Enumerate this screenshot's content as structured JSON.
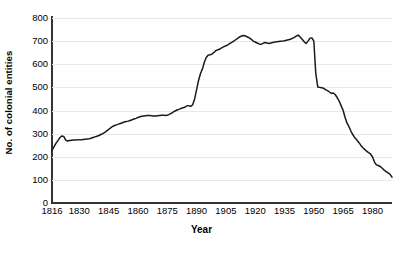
{
  "chart_data": {
    "type": "line",
    "title": "",
    "xlabel": "Year",
    "ylabel": "No. of colonial entities",
    "xlim": [
      1816,
      1990
    ],
    "ylim": [
      0,
      800
    ],
    "grid": true,
    "legend": false,
    "x_ticks": [
      "1816",
      "1830",
      "1845",
      "1860",
      "1875",
      "1890",
      "1905",
      "1920",
      "1935",
      "1950",
      "1965",
      "1980"
    ],
    "x_tick_values": [
      1816,
      1830,
      1845,
      1860,
      1875,
      1890,
      1905,
      1920,
      1935,
      1950,
      1965,
      1980
    ],
    "y_ticks": [
      "0",
      "100",
      "200",
      "300",
      "400",
      "500",
      "600",
      "700",
      "800"
    ],
    "y_tick_values": [
      0,
      100,
      200,
      300,
      400,
      500,
      600,
      700,
      800
    ],
    "line_color": "#1a1a1a",
    "grid_color": "#e8e8e8",
    "axis_color": "#333333",
    "series": [
      {
        "name": "No. of colonial entities",
        "x": [
          1816,
          1817,
          1818,
          1819,
          1820,
          1821,
          1822,
          1823,
          1824,
          1825,
          1826,
          1827,
          1828,
          1829,
          1830,
          1831,
          1832,
          1833,
          1834,
          1835,
          1836,
          1837,
          1838,
          1839,
          1840,
          1841,
          1842,
          1843,
          1844,
          1845,
          1846,
          1847,
          1848,
          1849,
          1850,
          1851,
          1852,
          1853,
          1854,
          1855,
          1856,
          1857,
          1858,
          1859,
          1860,
          1861,
          1862,
          1863,
          1864,
          1865,
          1866,
          1867,
          1868,
          1869,
          1870,
          1871,
          1872,
          1873,
          1874,
          1875,
          1876,
          1877,
          1878,
          1879,
          1880,
          1881,
          1882,
          1883,
          1884,
          1885,
          1886,
          1887,
          1888,
          1889,
          1890,
          1891,
          1892,
          1893,
          1894,
          1895,
          1896,
          1897,
          1898,
          1899,
          1900,
          1901,
          1902,
          1903,
          1904,
          1905,
          1906,
          1907,
          1908,
          1909,
          1910,
          1911,
          1912,
          1913,
          1914,
          1915,
          1916,
          1917,
          1918,
          1919,
          1920,
          1921,
          1922,
          1923,
          1924,
          1925,
          1926,
          1927,
          1928,
          1929,
          1930,
          1931,
          1932,
          1933,
          1934,
          1935,
          1936,
          1937,
          1938,
          1939,
          1940,
          1941,
          1942,
          1943,
          1944,
          1945,
          1946,
          1947,
          1948,
          1949,
          1950,
          1951,
          1952,
          1953,
          1954,
          1955,
          1956,
          1957,
          1958,
          1959,
          1960,
          1961,
          1962,
          1963,
          1964,
          1965,
          1966,
          1967,
          1968,
          1969,
          1970,
          1971,
          1972,
          1973,
          1974,
          1975,
          1976,
          1977,
          1978,
          1979,
          1980,
          1981,
          1982,
          1983,
          1984,
          1985,
          1986,
          1987,
          1988,
          1989,
          1990
        ],
        "values": [
          227,
          243,
          258,
          270,
          282,
          290,
          288,
          272,
          268,
          270,
          271,
          272,
          272,
          273,
          273,
          274,
          275,
          276,
          277,
          278,
          280,
          283,
          286,
          289,
          292,
          296,
          300,
          305,
          312,
          318,
          325,
          331,
          335,
          338,
          341,
          344,
          347,
          350,
          352,
          354,
          357,
          360,
          363,
          366,
          370,
          373,
          375,
          376,
          377,
          378,
          378,
          377,
          376,
          376,
          377,
          378,
          379,
          380,
          378,
          379,
          383,
          388,
          393,
          398,
          402,
          405,
          409,
          412,
          414,
          420,
          421,
          418,
          425,
          450,
          490,
          530,
          560,
          580,
          610,
          630,
          640,
          641,
          645,
          652,
          660,
          663,
          666,
          672,
          676,
          680,
          684,
          690,
          695,
          700,
          706,
          712,
          718,
          722,
          724,
          722,
          718,
          714,
          708,
          700,
          696,
          692,
          688,
          686,
          690,
          694,
          692,
          690,
          692,
          694,
          696,
          697,
          698,
          699,
          700,
          702,
          704,
          706,
          708,
          712,
          716,
          722,
          726,
          718,
          708,
          698,
          690,
          700,
          712,
          714,
          700,
          560,
          502,
          500,
          498,
          496,
          490,
          486,
          480,
          474,
          476,
          468,
          455,
          440,
          420,
          400,
          370,
          345,
          330,
          310,
          295,
          282,
          272,
          262,
          250,
          240,
          232,
          224,
          218,
          212,
          200,
          178,
          165,
          162,
          158,
          150,
          142,
          136,
          130,
          124,
          112
        ]
      }
    ]
  }
}
